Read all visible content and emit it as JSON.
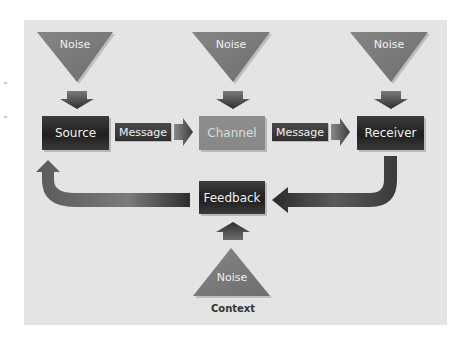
{
  "diagram": {
    "noise_label": "Noise",
    "top_noise": [
      {
        "label": "Noise",
        "position": "above-source"
      },
      {
        "label": "Noise",
        "position": "above-channel"
      },
      {
        "label": "Noise",
        "position": "above-receiver"
      }
    ],
    "bottom_noise": {
      "label": "Noise",
      "position": "below-feedback"
    },
    "nodes": {
      "source": "Source",
      "channel": "Channel",
      "receiver": "Receiver",
      "feedback": "Feedback"
    },
    "edges": [
      {
        "from": "Source",
        "to": "Channel",
        "label": "Message"
      },
      {
        "from": "Channel",
        "to": "Receiver",
        "label": "Message"
      },
      {
        "from": "Receiver",
        "to": "Feedback",
        "label": ""
      },
      {
        "from": "Feedback",
        "to": "Source",
        "label": ""
      }
    ],
    "message_labels": [
      "Message",
      "Message"
    ],
    "context_label": "Context",
    "colors": {
      "panel": "#e4e4e4",
      "noise_triangle": "#7a7a7a",
      "dark_box": "#262626",
      "channel_box": "#8a8a8a",
      "arrow": "#4a4a4a"
    }
  }
}
